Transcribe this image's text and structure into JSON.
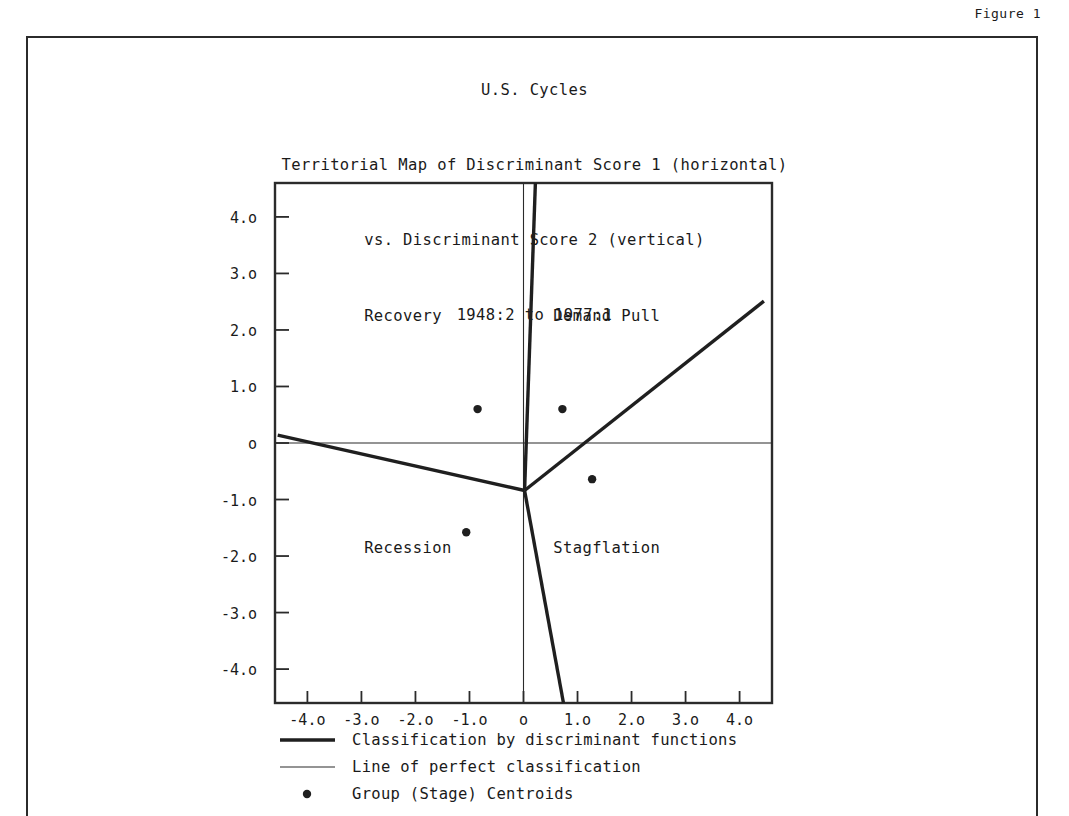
{
  "figure": {
    "label": "Figure 1"
  },
  "title": {
    "line1": "U.S. Cycles",
    "line2": "Territorial Map of Discriminant Score 1 (horizontal)",
    "line3": "vs. Discriminant Score 2 (vertical)",
    "line4": "1948:2 to 1977:1"
  },
  "chart_data": {
    "type": "scatter",
    "xlabel": "Discriminant Score 1",
    "ylabel": "Discriminant Score 2",
    "xlim": [
      -4.6,
      4.6
    ],
    "ylim": [
      -4.6,
      4.6
    ],
    "grid": false,
    "legend_position": "below-axis",
    "x_tick_labels": [
      "-4.o",
      "-3.o",
      "-2.o",
      "-1.o",
      "o",
      "1.o",
      "2.o",
      "3.o",
      "4.o"
    ],
    "x_tick_values": [
      -4,
      -3,
      -2,
      -1,
      0,
      1,
      2,
      3,
      4
    ],
    "y_tick_labels": [
      "4.o",
      "3.o",
      "2.o",
      "1.o",
      "o",
      "-1.o",
      "-2.o",
      "-3.o",
      "-4.o"
    ],
    "y_tick_values": [
      4,
      3,
      2,
      1,
      0,
      -1,
      -2,
      -3,
      -4
    ],
    "series": [
      {
        "name": "Group (Stage) Centroids",
        "marker": "dot",
        "points": [
          {
            "label": "Recovery",
            "x": -0.85,
            "y": 0.6
          },
          {
            "label": "Demand Pull",
            "x": 0.72,
            "y": 0.6
          },
          {
            "label": "Stagflation",
            "x": 1.27,
            "y": -0.64
          },
          {
            "label": "Recession",
            "x": -1.06,
            "y": -1.58
          }
        ]
      }
    ],
    "region_labels": [
      {
        "text": "Recovery",
        "x": -2.95,
        "y": 2.15
      },
      {
        "text": "Demand Pull",
        "x": 0.55,
        "y": 2.15
      },
      {
        "text": "Recession",
        "x": -2.95,
        "y": -1.95
      },
      {
        "text": "Stagflation",
        "x": 0.55,
        "y": -1.95
      }
    ],
    "boundaries": {
      "classification_vertex": {
        "x": 0.02,
        "y": -0.84
      },
      "classification_rays": [
        {
          "name": "west-ray",
          "to": {
            "x": -4.55,
            "y": 0.14
          }
        },
        {
          "name": "north-ray",
          "to": {
            "x": 0.22,
            "y": 4.6
          }
        },
        {
          "name": "east-ray",
          "to": {
            "x": 4.45,
            "y": 2.51
          }
        },
        {
          "name": "south-ray",
          "to": {
            "x": 0.74,
            "y": -4.6
          }
        }
      ],
      "perfect_classification_lines": [
        {
          "name": "horizontal-zero-line",
          "y": 0
        },
        {
          "name": "vertical-zero-line",
          "x": 0
        }
      ]
    },
    "annotations": []
  },
  "legend": {
    "items": [
      {
        "marker": "thick-line",
        "label": "Classification by discriminant functions"
      },
      {
        "marker": "thin-line",
        "label": "Line of perfect classification"
      },
      {
        "marker": "dot",
        "label": "Group (Stage) Centroids"
      }
    ]
  },
  "colors": {
    "ink": "#1f1f1f",
    "frame": "#2b2b2b",
    "paper": "#ffffff"
  }
}
